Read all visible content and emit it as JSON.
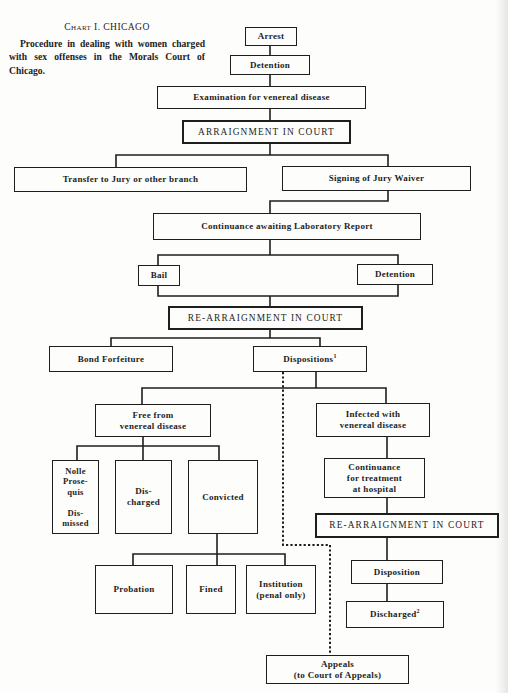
{
  "caption": {
    "title": "Chart I. CHICAGO",
    "description": "Procedure in dealing with women charged with sex offenses in the Morals Court of Chicago."
  },
  "nodes": {
    "arrest": "Arrest",
    "detention_initial": "Detention",
    "examination": "Examination for venereal disease",
    "arraignment": "ARRAIGNMENT IN COURT",
    "transfer": "Transfer to Jury or other branch",
    "jury_waiver": "Signing of Jury Waiver",
    "continuance_lab": "Continuance awaiting Laboratory Report",
    "bail": "Bail",
    "detention_lab": "Detention",
    "rearraignment": "RE-ARRAIGNMENT IN COURT",
    "bond_forfeiture": "Bond Forfeiture",
    "dispositions": "Dispositions",
    "dispositions_footnote": "1",
    "free": "Free from\nvenereal disease",
    "infected": "Infected with\nvenereal disease",
    "nolle": "Nolle\nProse-\nquis\n\nDis-\nmissed",
    "discharged": "Dis-\ncharged",
    "convicted": "Convicted",
    "probation": "Probation",
    "fined": "Fined",
    "institution": "Institution\n(penal only)",
    "continuance_hospital": "Continuance\nfor treatment\nat hospital",
    "rearraignment_2": "RE-ARRAIGNMENT IN COURT",
    "disposition": "Disposition",
    "discharged_2": "Discharged",
    "discharged_2_footnote": "2",
    "appeals": "Appeals\n(to Court of Appeals)"
  }
}
